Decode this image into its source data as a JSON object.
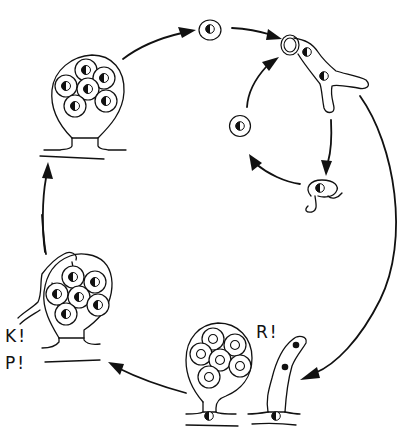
{
  "diagram": {
    "type": "life-cycle",
    "background": "#ffffff",
    "ink_color": "#111111",
    "labels": {
      "k": "K!",
      "p": "P!",
      "r": "R!"
    },
    "stages": [
      {
        "id": "sporangium-top-left",
        "description": "Mature sporangium on hypha containing six half-filled-nucleus spores"
      },
      {
        "id": "free-spore-top",
        "description": "Released spore with half-filled nucleus"
      },
      {
        "id": "germinating-thallus",
        "description": "Germinating spore forming branched hypha with two nuclei"
      },
      {
        "id": "encysted-spore",
        "description": "Round encysted spore with half-filled nucleus"
      },
      {
        "id": "flagellated-zoospore",
        "description": "Zoospore with flagella and half-filled nucleus"
      },
      {
        "id": "hypha-with-nuclei",
        "description": "Upright hypha with two solid nuclei"
      },
      {
        "id": "sporangium-bottom-center",
        "description": "Young sporangium with six open-nucleus spores"
      },
      {
        "id": "sporangium-bottom-left",
        "description": "Sporangium with hyphal contact, six spores"
      }
    ],
    "arrows": [
      {
        "from": "sporangium-top-left",
        "to": "free-spore-top"
      },
      {
        "from": "free-spore-top",
        "to": "germinating-thallus"
      },
      {
        "from": "germinating-thallus",
        "to": "flagellated-zoospore"
      },
      {
        "from": "flagellated-zoospore",
        "to": "encysted-spore"
      },
      {
        "from": "encysted-spore",
        "to": "germinating-thallus"
      },
      {
        "from": "germinating-thallus",
        "to": "hypha-with-nuclei"
      },
      {
        "from": "sporangium-bottom-center",
        "to": "sporangium-bottom-left"
      },
      {
        "from": "sporangium-bottom-left",
        "to": "sporangium-top-left"
      }
    ]
  }
}
